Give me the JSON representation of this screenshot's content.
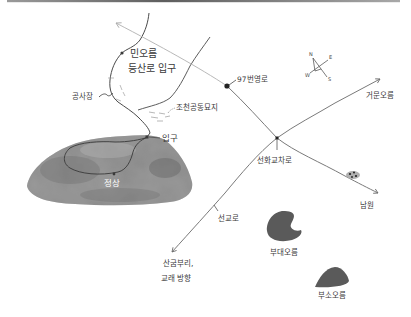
{
  "map": {
    "labels": {
      "minoreum_line1": "민오름",
      "minoreum_line2": "등산로 입구",
      "construction": "공사장",
      "cemetery": "조천공동묘지",
      "road97": "97번영로",
      "geomunoreum": "거문오름",
      "intersection": "선화교차로",
      "namwon": "남원",
      "seongyoro": "선교로",
      "sangumburi_line1": "산굼부리,",
      "sangumburi_line2": "교래 방향",
      "budaeoreum": "부대오름",
      "busooreum": "부소오름",
      "entrance": "입구",
      "summit": "정상"
    },
    "compass": {
      "n": "N",
      "e": "E",
      "s": "S",
      "w": "W"
    }
  },
  "colors": {
    "top_rule": "#6e6e6e",
    "main_road": "#7a7a7a",
    "faded_road": "#b9b9b9",
    "trail": "#4a4a4a",
    "mountain": "#8c8c8c",
    "oreum": "#5a5a5a"
  }
}
